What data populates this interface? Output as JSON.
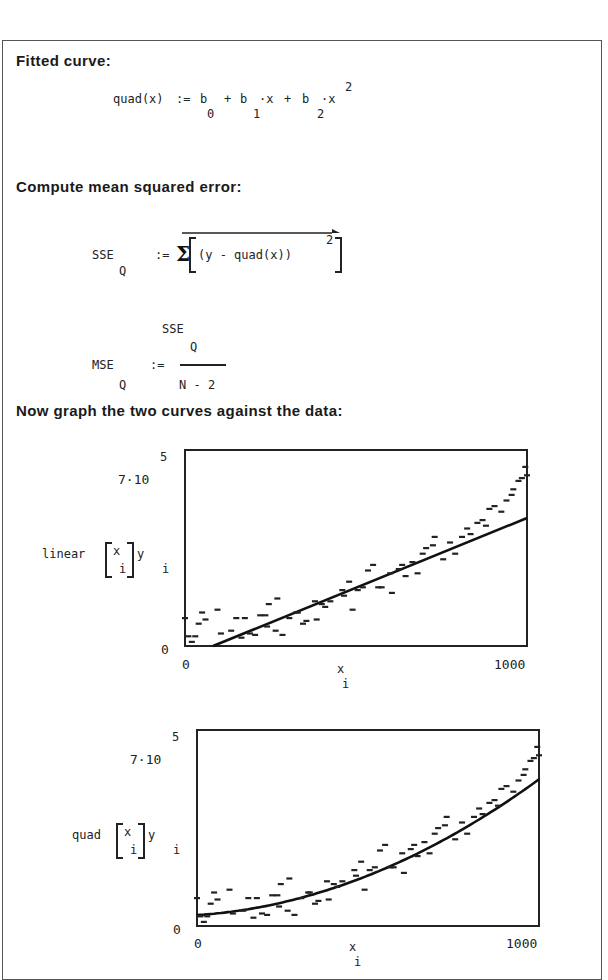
{
  "document": {
    "headings": {
      "fitted_curve": "Fitted curve:",
      "compute_mse": "Compute mean squared error:",
      "graph_curves": "Now graph the two curves against the data:"
    },
    "formula_quad": {
      "lhs": "quad(x)",
      "assign": ":=",
      "terms": [
        "b",
        "+",
        "b",
        "·x",
        "+",
        "b",
        "·x"
      ],
      "subscripts": [
        "0",
        "1",
        "2"
      ],
      "superscript": "2"
    },
    "formula_sse": {
      "lhs": "SSE",
      "lhs_sub": "Q",
      "assign": ":=",
      "sigma": "Σ",
      "body": "(y - quad(x))",
      "exponent": "2"
    },
    "formula_mse": {
      "lhs": "MSE",
      "lhs_sub": "Q",
      "assign": ":=",
      "numerator": "SSE",
      "numerator_sub": "Q",
      "denominator": "N - 2"
    }
  },
  "chart_data": [
    {
      "type": "scatter",
      "title": "",
      "ylabel": "linear[x_i], y_i",
      "ylabel_func": "linear",
      "xlabel": "x_i",
      "xlabel_var": "x",
      "xlabel_sub": "i",
      "ylabel_var": "y",
      "ylabel_sub": "i",
      "xlim": [
        0,
        1000
      ],
      "ylim": [
        0,
        700000
      ],
      "y_top_label": "7·10",
      "y_top_exp": "5",
      "y_bottom_label": "0",
      "x_left_label": "0",
      "x_right_label": "1000",
      "grid": false,
      "series": [
        {
          "name": "linear fit",
          "kind": "line",
          "x": [
            82,
            1000
          ],
          "y": [
            0,
            457000
          ]
        },
        {
          "name": "data",
          "kind": "points",
          "points": [
            [
              0,
              100000
            ],
            [
              10,
              35000
            ],
            [
              20,
              15000
            ],
            [
              30,
              35000
            ],
            [
              40,
              80000
            ],
            [
              50,
              120000
            ],
            [
              60,
              95000
            ],
            [
              95,
              130000
            ],
            [
              105,
              45000
            ],
            [
              135,
              55000
            ],
            [
              150,
              100000
            ],
            [
              165,
              30000
            ],
            [
              175,
              100000
            ],
            [
              190,
              45000
            ],
            [
              205,
              40000
            ],
            [
              220,
              110000
            ],
            [
              235,
              110000
            ],
            [
              240,
              70000
            ],
            [
              245,
              150000
            ],
            [
              265,
              55000
            ],
            [
              270,
              170000
            ],
            [
              285,
              40000
            ],
            [
              305,
              100000
            ],
            [
              325,
              120000
            ],
            [
              330,
              120000
            ],
            [
              345,
              80000
            ],
            [
              355,
              90000
            ],
            [
              380,
              160000
            ],
            [
              385,
              95000
            ],
            [
              400,
              150000
            ],
            [
              410,
              140000
            ],
            [
              425,
              160000
            ],
            [
              460,
              200000
            ],
            [
              465,
              180000
            ],
            [
              480,
              230000
            ],
            [
              490,
              130000
            ],
            [
              505,
              200000
            ],
            [
              520,
              210000
            ],
            [
              535,
              270000
            ],
            [
              550,
              290000
            ],
            [
              565,
              210000
            ],
            [
              575,
              210000
            ],
            [
              600,
              260000
            ],
            [
              605,
              190000
            ],
            [
              625,
              275000
            ],
            [
              635,
              290000
            ],
            [
              645,
              250000
            ],
            [
              665,
              300000
            ],
            [
              680,
              260000
            ],
            [
              695,
              330000
            ],
            [
              705,
              350000
            ],
            [
              725,
              360000
            ],
            [
              730,
              390000
            ],
            [
              755,
              310000
            ],
            [
              775,
              370000
            ],
            [
              790,
              330000
            ],
            [
              810,
              390000
            ],
            [
              825,
              420000
            ],
            [
              835,
              400000
            ],
            [
              855,
              440000
            ],
            [
              870,
              450000
            ],
            [
              880,
              430000
            ],
            [
              890,
              490000
            ],
            [
              905,
              500000
            ],
            [
              925,
              480000
            ],
            [
              940,
              520000
            ],
            [
              955,
              540000
            ],
            [
              960,
              560000
            ],
            [
              975,
              590000
            ],
            [
              985,
              600000
            ],
            [
              995,
              640000
            ],
            [
              1000,
              610000
            ]
          ]
        }
      ]
    },
    {
      "type": "scatter",
      "title": "",
      "ylabel": "quad[x_i], y_i",
      "ylabel_func": "quad",
      "xlabel": "x_i",
      "xlabel_var": "x",
      "xlabel_sub": "i",
      "ylabel_var": "y",
      "ylabel_sub": "i",
      "xlim": [
        0,
        1000
      ],
      "ylim": [
        0,
        700000
      ],
      "y_top_label": "7·10",
      "y_top_exp": "5",
      "y_bottom_label": "0",
      "x_left_label": "0",
      "x_right_label": "1000",
      "grid": false,
      "series": [
        {
          "name": "quadratic fit",
          "kind": "curve",
          "coefficients": {
            "b0": 39000,
            "b1": 80,
            "b2": 0.405
          }
        },
        {
          "name": "data",
          "kind": "points",
          "points": [
            [
              0,
              100000
            ],
            [
              10,
              35000
            ],
            [
              20,
              15000
            ],
            [
              30,
              35000
            ],
            [
              40,
              80000
            ],
            [
              50,
              120000
            ],
            [
              60,
              95000
            ],
            [
              95,
              130000
            ],
            [
              105,
              45000
            ],
            [
              135,
              55000
            ],
            [
              150,
              100000
            ],
            [
              165,
              30000
            ],
            [
              175,
              100000
            ],
            [
              190,
              45000
            ],
            [
              205,
              40000
            ],
            [
              220,
              110000
            ],
            [
              235,
              110000
            ],
            [
              240,
              70000
            ],
            [
              245,
              150000
            ],
            [
              265,
              55000
            ],
            [
              270,
              170000
            ],
            [
              285,
              40000
            ],
            [
              305,
              100000
            ],
            [
              325,
              120000
            ],
            [
              330,
              120000
            ],
            [
              345,
              80000
            ],
            [
              355,
              90000
            ],
            [
              380,
              160000
            ],
            [
              385,
              95000
            ],
            [
              400,
              150000
            ],
            [
              410,
              140000
            ],
            [
              425,
              160000
            ],
            [
              460,
              200000
            ],
            [
              465,
              180000
            ],
            [
              480,
              230000
            ],
            [
              490,
              130000
            ],
            [
              505,
              200000
            ],
            [
              520,
              210000
            ],
            [
              535,
              270000
            ],
            [
              550,
              290000
            ],
            [
              565,
              210000
            ],
            [
              575,
              210000
            ],
            [
              600,
              260000
            ],
            [
              605,
              190000
            ],
            [
              625,
              275000
            ],
            [
              635,
              290000
            ],
            [
              645,
              250000
            ],
            [
              665,
              300000
            ],
            [
              680,
              260000
            ],
            [
              695,
              330000
            ],
            [
              705,
              350000
            ],
            [
              725,
              360000
            ],
            [
              730,
              390000
            ],
            [
              755,
              310000
            ],
            [
              775,
              370000
            ],
            [
              790,
              330000
            ],
            [
              810,
              390000
            ],
            [
              825,
              420000
            ],
            [
              835,
              400000
            ],
            [
              855,
              440000
            ],
            [
              870,
              450000
            ],
            [
              880,
              430000
            ],
            [
              890,
              490000
            ],
            [
              905,
              500000
            ],
            [
              925,
              480000
            ],
            [
              940,
              520000
            ],
            [
              955,
              540000
            ],
            [
              960,
              560000
            ],
            [
              975,
              590000
            ],
            [
              985,
              600000
            ],
            [
              995,
              640000
            ],
            [
              1000,
              610000
            ]
          ]
        }
      ]
    }
  ]
}
